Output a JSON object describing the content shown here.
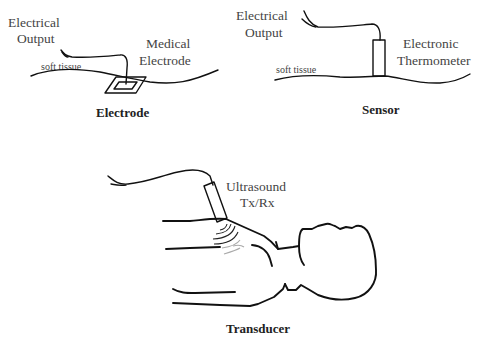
{
  "figure": {
    "panels": [
      {
        "id": "electrode",
        "caption": "Electrode",
        "labels": {
          "output_line1": "Electrical",
          "output_line2": "Output",
          "device_line1": "Medical",
          "device_line2": "Electrode",
          "tissue": "soft tissue"
        }
      },
      {
        "id": "sensor",
        "caption": "Sensor",
        "labels": {
          "output_line1": "Electrical",
          "output_line2": "Output",
          "device_line1": "Electronic",
          "device_line2": "Thermometer",
          "tissue": "soft tissue"
        }
      },
      {
        "id": "transducer",
        "caption": "Transducer",
        "labels": {
          "device_line1": "Ultrasound",
          "device_line2": "Tx/Rx"
        }
      }
    ],
    "colors": {
      "line": "#111111",
      "text": "#444444",
      "wave_near": "#222222",
      "wave_far": "#aaaaaa"
    }
  }
}
